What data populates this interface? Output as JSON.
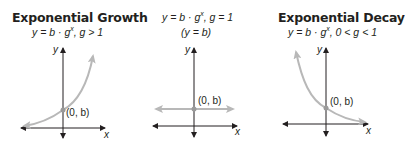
{
  "colors": {
    "axis": "#231f20",
    "curve": "#b8b8b8",
    "point": "#9a9a9a",
    "text": "#231f20"
  },
  "panels": [
    {
      "id": "growth",
      "title": "Exponential Growth",
      "equation": {
        "lhs": "y = b · g",
        "exp": "x",
        "rhs": ",  g > 1"
      },
      "sub_equation": "",
      "point_label": "(0, b)",
      "axis_x_label": "x",
      "axis_y_label": "y"
    },
    {
      "id": "constant",
      "title": "",
      "equation": {
        "lhs": "y = b · g",
        "exp": "x",
        "rhs": ",  g = 1"
      },
      "sub_equation": "(y = b)",
      "point_label": "(0, b)",
      "axis_x_label": "x",
      "axis_y_label": "y"
    },
    {
      "id": "decay",
      "title": "Exponential Decay",
      "equation": {
        "lhs": "y = b · g",
        "exp": "x",
        "rhs": ",  0 < g < 1"
      },
      "sub_equation": "",
      "point_label": "(0, b)",
      "axis_x_label": "x",
      "axis_y_label": "y"
    }
  ]
}
